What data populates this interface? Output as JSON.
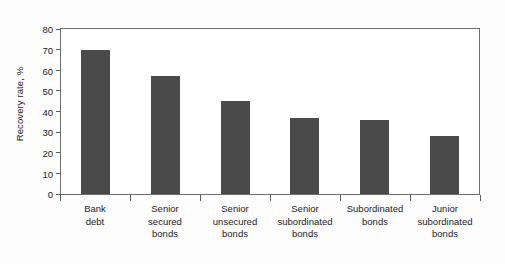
{
  "chart_data": {
    "type": "bar",
    "title": "",
    "xlabel": "",
    "ylabel": "Recovery rate, %",
    "ylim": [
      0,
      80
    ],
    "yticks": [
      0,
      10,
      20,
      30,
      40,
      50,
      60,
      70,
      80
    ],
    "grid": false,
    "legend": false,
    "bar_color": "#4a4a4a",
    "categories": [
      "Bank debt",
      "Senior secured bonds",
      "Senior unsecured bonds",
      "Senior subordinated bonds",
      "Subordinated bonds",
      "Junior subordinated bonds"
    ],
    "category_lines": [
      [
        "Bank",
        "debt"
      ],
      [
        "Senior",
        "secured",
        "bonds"
      ],
      [
        "Senior",
        "unsecured",
        "bonds"
      ],
      [
        "Senior",
        "subordinated",
        "bonds"
      ],
      [
        "Subordinated",
        "bonds"
      ],
      [
        "Junior",
        "subordinated",
        "bonds"
      ]
    ],
    "values": [
      70,
      57,
      45,
      37,
      36,
      28
    ]
  }
}
